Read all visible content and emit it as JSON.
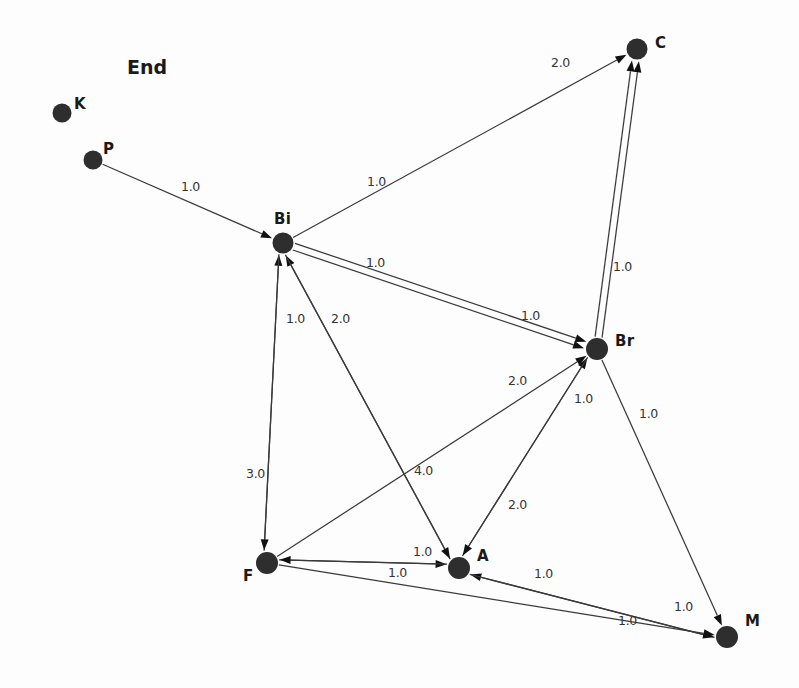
{
  "figure": {
    "width": 799,
    "height": 688,
    "background_color": "#fdfdfd",
    "node_color": "#2e2e2e",
    "edge_color": "#3a3a3a",
    "text_color": "#1a1a1a"
  },
  "annotations": [
    {
      "text": "End",
      "x": 127,
      "y": 58
    }
  ],
  "chart_data": {
    "type": "diagram",
    "subtype": "directed-weighted-graph",
    "title": "End",
    "nodes": [
      {
        "id": "K",
        "label": "K",
        "x": 62,
        "y": 113,
        "r": 9.5,
        "label_x": 74,
        "label_y": 97
      },
      {
        "id": "P",
        "label": "P",
        "x": 93,
        "y": 160,
        "r": 9.5,
        "label_x": 103,
        "label_y": 142
      },
      {
        "id": "Bi",
        "label": "Bi",
        "x": 283,
        "y": 243,
        "r": 10.5,
        "label_x": 274,
        "label_y": 212
      },
      {
        "id": "C",
        "label": "C",
        "x": 637,
        "y": 49,
        "r": 10.5,
        "label_x": 655,
        "label_y": 36
      },
      {
        "id": "Br",
        "label": "Br",
        "x": 597,
        "y": 349,
        "r": 11.0,
        "label_x": 615,
        "label_y": 334
      },
      {
        "id": "F",
        "label": "F",
        "x": 267,
        "y": 563,
        "r": 11.0,
        "label_x": 243,
        "label_y": 569
      },
      {
        "id": "A",
        "label": "A",
        "x": 459,
        "y": 568,
        "r": 11.0,
        "label_x": 477,
        "label_y": 549
      },
      {
        "id": "M",
        "label": "M",
        "x": 727,
        "y": 637,
        "r": 11.0,
        "label_x": 745,
        "label_y": 614
      }
    ],
    "edges": [
      {
        "source": "P",
        "target": "Bi",
        "weight": "1.0",
        "label_x": 181,
        "label_y": 181
      },
      {
        "source": "Bi",
        "target": "C",
        "weight": "1.0",
        "label_x": 367,
        "label_y": 176
      },
      {
        "source": "Br",
        "target": "C",
        "weight": "2.0",
        "label_x": 551,
        "label_y": 57,
        "anchor": "mid"
      },
      {
        "source": "Br",
        "target": "C",
        "weight": "1.0",
        "label_x": 613,
        "label_y": 261
      },
      {
        "source": "Bi",
        "target": "Br",
        "weight": "1.0",
        "label_x": 366,
        "label_y": 257
      },
      {
        "source": "Bi",
        "target": "Br",
        "weight": "1.0",
        "label_x": 521,
        "label_y": 310
      },
      {
        "source": "F",
        "target": "Bi",
        "weight": "1.0",
        "label_x": 286,
        "label_y": 313
      },
      {
        "source": "A",
        "target": "Bi",
        "weight": "2.0",
        "label_x": 331,
        "label_y": 313
      },
      {
        "source": "Bi",
        "target": "F",
        "weight": "3.0",
        "label_x": 246,
        "label_y": 468
      },
      {
        "source": "Bi",
        "target": "A",
        "weight": "4.0",
        "label_x": 414,
        "label_y": 465
      },
      {
        "source": "F",
        "target": "Br",
        "weight": "2.0",
        "label_x": 508,
        "label_y": 375
      },
      {
        "source": "A",
        "target": "Br",
        "weight": "1.0",
        "label_x": 574,
        "label_y": 393
      },
      {
        "source": "Br",
        "target": "M",
        "weight": "1.0",
        "label_x": 639,
        "label_y": 408
      },
      {
        "source": "Br",
        "target": "A",
        "weight": "2.0",
        "label_x": 508,
        "label_y": 499
      },
      {
        "source": "F",
        "target": "A",
        "weight": "1.0",
        "label_x": 413,
        "label_y": 546
      },
      {
        "source": "A",
        "target": "F",
        "weight": "1.0",
        "label_x": 388,
        "label_y": 567
      },
      {
        "source": "M",
        "target": "A",
        "weight": "1.0",
        "label_x": 534,
        "label_y": 568
      },
      {
        "source": "A",
        "target": "M",
        "weight": "1.0",
        "label_x": 674,
        "label_y": 601
      },
      {
        "source": "F",
        "target": "M",
        "weight": "1.0",
        "label_x": 618,
        "label_y": 615
      }
    ],
    "legend": [],
    "xlabel": "",
    "ylabel": ""
  }
}
